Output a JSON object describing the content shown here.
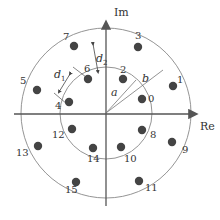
{
  "diagram": {
    "axes": {
      "x_label": "Re",
      "y_label": "Im"
    },
    "labels": {
      "a": "a",
      "b": "b",
      "d1": "d",
      "d1_sub": "1",
      "d2": "d",
      "d2_sub": "2"
    },
    "center": [
      106,
      113
    ],
    "inner_radius": 46,
    "outer_radius": 85,
    "colors": {
      "point": "#444444",
      "circle": "#888888",
      "axis": "#555555"
    },
    "points": [
      {
        "label": "0",
        "x": 142,
        "y": 99,
        "lx": 148,
        "ly": 102
      },
      {
        "label": "1",
        "x": 173,
        "y": 86,
        "lx": 177,
        "ly": 83
      },
      {
        "label": "2",
        "x": 123,
        "y": 79,
        "lx": 120,
        "ly": 73
      },
      {
        "label": "3",
        "x": 138,
        "y": 47,
        "lx": 135,
        "ly": 39
      },
      {
        "label": "4",
        "x": 69,
        "y": 102,
        "lx": 55,
        "ly": 109
      },
      {
        "label": "5",
        "x": 37,
        "y": 90,
        "lx": 20,
        "ly": 84
      },
      {
        "label": "6",
        "x": 88,
        "y": 79,
        "lx": 84,
        "ly": 72
      },
      {
        "label": "7",
        "x": 74,
        "y": 46,
        "lx": 63,
        "ly": 40
      },
      {
        "label": "8",
        "x": 142,
        "y": 130,
        "lx": 150,
        "ly": 138
      },
      {
        "label": "9",
        "x": 172,
        "y": 142,
        "lx": 182,
        "ly": 153
      },
      {
        "label": "10",
        "x": 121,
        "y": 147,
        "lx": 124,
        "ly": 162
      },
      {
        "label": "11",
        "x": 139,
        "y": 181,
        "lx": 145,
        "ly": 191
      },
      {
        "label": "12",
        "x": 72,
        "y": 129,
        "lx": 52,
        "ly": 138
      },
      {
        "label": "13",
        "x": 38,
        "y": 146,
        "lx": 16,
        "ly": 156
      },
      {
        "label": "14",
        "x": 93,
        "y": 148,
        "lx": 87,
        "ly": 162
      },
      {
        "label": "15",
        "x": 76,
        "y": 182,
        "lx": 65,
        "ly": 193
      }
    ]
  }
}
